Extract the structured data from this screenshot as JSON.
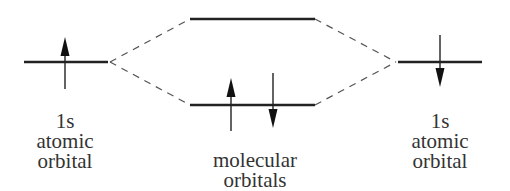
{
  "diagram": {
    "type": "molecular-orbital-energy-diagram",
    "left_atom": {
      "label_line1": "1s",
      "label_line2": "atomic",
      "label_line3": "orbital",
      "electron_spin": "up"
    },
    "right_atom": {
      "label_line1": "1s",
      "label_line2": "atomic",
      "label_line3": "orbital",
      "electron_spin": "down"
    },
    "molecular_orbitals": {
      "label_line1": "molecular",
      "label_line2": "orbitals",
      "antibonding": {
        "electrons": []
      },
      "bonding": {
        "electrons": [
          "up",
          "down"
        ]
      }
    },
    "colors": {
      "line": "#222222",
      "dashed": "#555555",
      "text": "#333333"
    }
  }
}
